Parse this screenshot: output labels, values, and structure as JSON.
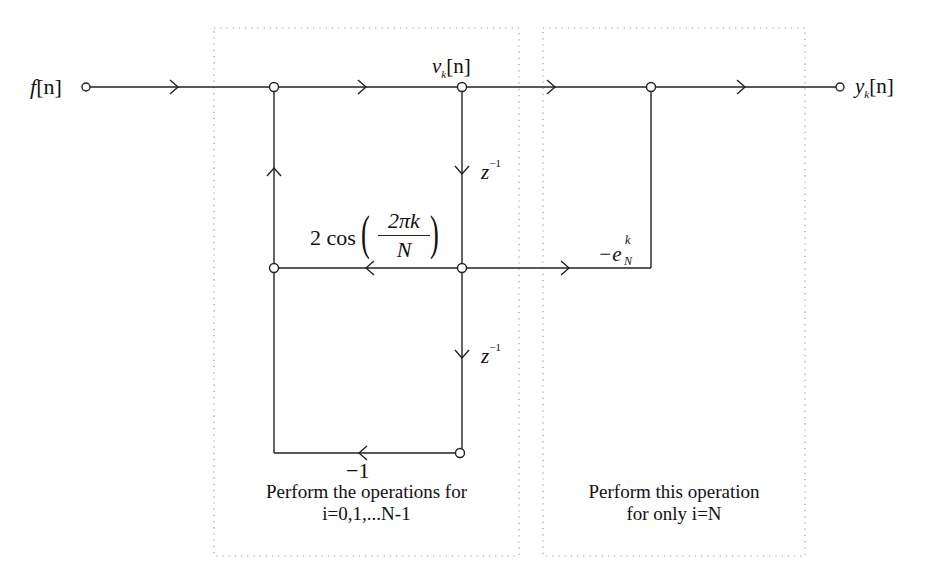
{
  "diagram": {
    "type": "signal-flow-graph",
    "labels": {
      "input": "f[n]",
      "input_f": "f",
      "input_idx": "[n]",
      "output_y": "y",
      "output_sub": "k",
      "output_idx": "[n]",
      "state_v": "v",
      "state_sub": "k",
      "state_idx": "[n]",
      "delay1_z": "z",
      "delay1_exp": "−1",
      "delay2_z": "z",
      "delay2_exp": "−1",
      "coef_prefix": "2 cos",
      "coef_num": "2πk",
      "coef_den": "N",
      "neg_one": "−1",
      "out_coef_prefix": "−e",
      "out_coef_sup": "k",
      "out_coef_sub": "N"
    },
    "captions": {
      "left_line1": "Perform the operations for",
      "left_line2": "i=0,1,...N-1",
      "right_line1": "Perform this operation",
      "right_line2": "for only i=N"
    },
    "colors": {
      "line": "#222222",
      "dotted_box": "#999999",
      "background": "#ffffff"
    }
  }
}
